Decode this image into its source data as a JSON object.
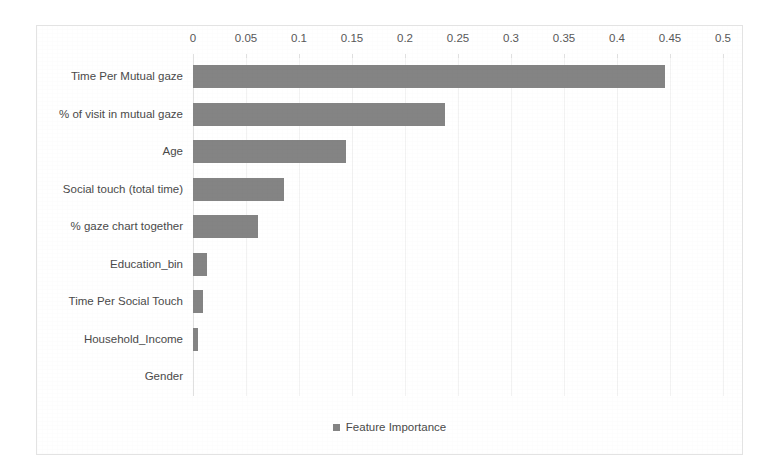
{
  "chart_data": {
    "type": "bar",
    "orientation": "horizontal",
    "title": "",
    "xlabel": "",
    "ylabel": "",
    "xlim": [
      0,
      0.5
    ],
    "xticks": [
      "0",
      "0.05",
      "0.1",
      "0.15",
      "0.2",
      "0.25",
      "0.3",
      "0.35",
      "0.4",
      "0.45",
      "0.5"
    ],
    "xtick_values": [
      0,
      0.05,
      0.1,
      0.15,
      0.2,
      0.25,
      0.3,
      0.35,
      0.4,
      0.45,
      0.5
    ],
    "grid": true,
    "grid_axis": "x",
    "legend": {
      "position": "bottom-center",
      "entries": [
        "Feature Importance"
      ]
    },
    "series_name": "Feature Importance",
    "bar_color": "#848484",
    "categories": [
      "Time Per Mutual gaze",
      "% of visit in mutual gaze",
      "Age",
      "Social touch (total time)",
      "% gaze chart together",
      "Education_bin",
      "Time Per Social Touch",
      "Household_Income",
      "Gender"
    ],
    "values": [
      0.445,
      0.238,
      0.144,
      0.086,
      0.061,
      0.013,
      0.009,
      0.005,
      0
    ]
  },
  "colors": {
    "bar": "#848484",
    "gridline": "#f2f2f2",
    "frame_border": "#e3e3e3",
    "text": "#4a4a4a"
  }
}
